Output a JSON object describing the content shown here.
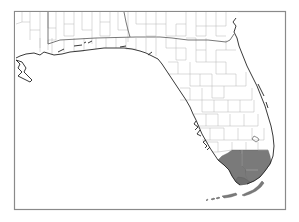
{
  "map": {
    "subject": "Florida county map",
    "highlighted_region": "South Florida",
    "highlighted_counties": [
      "Collier",
      "Monroe",
      "Miami-Dade"
    ],
    "colors": {
      "background": "#ffffff",
      "land": "#ffffff",
      "county_border": "#b0b0b0",
      "state_border": "#555555",
      "coastline": "#222222",
      "highlight_fill": "#7a7a7a",
      "frame": "#888888"
    }
  }
}
